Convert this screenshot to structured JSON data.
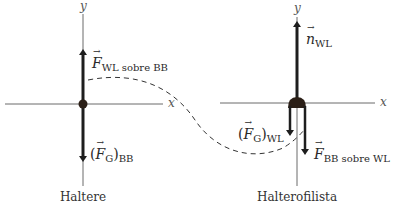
{
  "diagram": {
    "left": {
      "caption": "Haltere",
      "axis_x": "x",
      "axis_y": "y",
      "force_up": {
        "symbol": "F",
        "subscript": "WL sobre BB"
      },
      "force_down": {
        "open": "(",
        "symbol": "F",
        "sub_inner": "G",
        "close": ")",
        "subscript": "BB"
      }
    },
    "right": {
      "caption": "Halterofilista",
      "axis_x": "x",
      "axis_y": "y",
      "force_up": {
        "symbol": "n",
        "subscript": "WL"
      },
      "force_down_left": {
        "open": "(",
        "symbol": "F",
        "sub_inner": "G",
        "close": ")",
        "subscript": "WL"
      },
      "force_down_right": {
        "symbol": "F",
        "subscript": "BB sobre WL"
      }
    },
    "colors": {
      "axis": "#6a6a6a",
      "arrow": "#1e1e1e",
      "body": "#2b1f17",
      "dashed": "#333333"
    }
  }
}
